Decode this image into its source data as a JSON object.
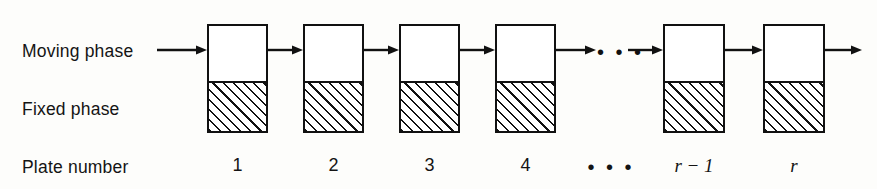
{
  "diagram": {
    "row_labels": {
      "moving_phase": "Moving phase",
      "fixed_phase": "Fixed phase",
      "plate_number": "Plate number"
    },
    "ellipsis_glyph": "• • •",
    "ellipsis_bottom_glyph": "• • •",
    "colors": {
      "ink": "#111111",
      "background": "#fdfdfb",
      "mobile_fill": "#ffffff",
      "hatch": "#111111"
    },
    "plates": [
      {
        "number": "1",
        "italic": false,
        "x": 207,
        "width": 61
      },
      {
        "number": "2",
        "italic": false,
        "x": 303,
        "width": 61
      },
      {
        "number": "3",
        "italic": false,
        "x": 399,
        "width": 61
      },
      {
        "number": "4",
        "italic": false,
        "x": 495,
        "width": 61
      },
      {
        "number": "r − 1",
        "italic": true,
        "x": 663,
        "width": 62
      },
      {
        "number": "r",
        "italic": true,
        "x": 763,
        "width": 62
      }
    ],
    "geometry": {
      "plate_top": 24,
      "plate_divider": 82,
      "plate_bottom": 133,
      "flow_line_y": 50
    },
    "arrows": [
      {
        "name": "inlet-arrow",
        "x1": 157,
        "x2": 207
      },
      {
        "name": "arrow-1-to-2",
        "x1": 268,
        "x2": 303
      },
      {
        "name": "arrow-2-to-3",
        "x1": 364,
        "x2": 399
      },
      {
        "name": "arrow-3-to-4",
        "x1": 460,
        "x2": 495
      },
      {
        "name": "arrow-4-to-gap",
        "x1": 556,
        "x2": 596
      },
      {
        "name": "arrow-gap-to-r1",
        "x1": 628,
        "x2": 663
      },
      {
        "name": "arrow-r1-to-r",
        "x1": 725,
        "x2": 763
      },
      {
        "name": "outlet-arrow",
        "x1": 825,
        "x2": 862
      }
    ],
    "inline_ellipsis": {
      "x": 597,
      "y": 42
    },
    "bottom_ellipsis": {
      "x": 611
    }
  }
}
